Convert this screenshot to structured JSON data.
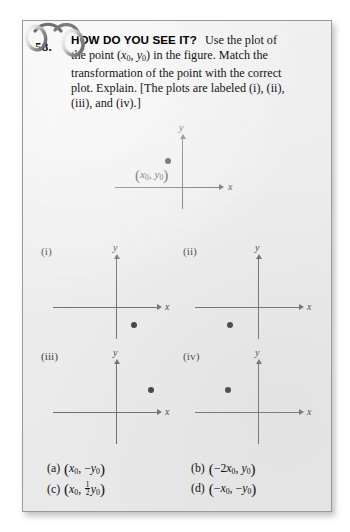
{
  "page": {
    "background_color": "#ededed",
    "border_color": "#9a9a9a",
    "outer_background": "#ffffff"
  },
  "problem": {
    "number": "58.",
    "callout_title": "HOW DO YOU SEE IT?",
    "body_line_1_pre": "Use the plot of",
    "body_line_2_a": "the point (",
    "body_line_2_x": "x",
    "body_line_2_sub0a": "0",
    "body_line_2_comma": ", ",
    "body_line_2_y": "y",
    "body_line_2_sub0b": "0",
    "body_line_2_b": ") in the figure. Match the",
    "body_line_3": "transformation of the point with the correct",
    "body_line_4": "plot. Explain. [The plots are labeled (i), (ii),",
    "body_line_5": "(iii), and (iv).]"
  },
  "main_plot": {
    "name": "main-plot",
    "axis_x_label": "x",
    "axis_y_label": "y",
    "point_label_open": "(",
    "point_label_x": "x",
    "point_label_x_sub": "0",
    "point_label_sep": ", ",
    "point_label_y": "y",
    "point_label_y_sub": "0",
    "point_label_close": ")",
    "point_quadrant": "II",
    "point_x_rel": -14,
    "point_y_rel": 26
  },
  "subplots": [
    {
      "id": "i",
      "label": "(i)",
      "axis_x_label": "x",
      "axis_y_label": "y",
      "point_quadrant": "IV",
      "point_x_rel": 18,
      "point_y_rel": -18
    },
    {
      "id": "ii",
      "label": "(ii)",
      "axis_x_label": "x",
      "axis_y_label": "y",
      "point_quadrant": "III",
      "point_x_rel": -28,
      "point_y_rel": -18
    },
    {
      "id": "iii",
      "label": "(iii)",
      "axis_x_label": "x",
      "axis_y_label": "y",
      "point_quadrant": "I",
      "point_x_rel": 35,
      "point_y_rel": 22
    },
    {
      "id": "iv",
      "label": "(iv)",
      "axis_x_label": "x",
      "axis_y_label": "y",
      "point_quadrant": "II",
      "point_x_rel": -30,
      "point_y_rel": 22
    }
  ],
  "answers": [
    {
      "tag": "(a)",
      "expr_plain": "(x0, -y0)",
      "x_sign": "",
      "x_coef": "",
      "x_var": "x",
      "x_sub": "0",
      "y_sign": "−",
      "y_coef": "",
      "y_var": "y",
      "y_sub": "0",
      "y_is_fraction": false
    },
    {
      "tag": "(b)",
      "expr_plain": "(-2x0, y0)",
      "x_sign": "−",
      "x_coef": "2",
      "x_var": "x",
      "x_sub": "0",
      "y_sign": "",
      "y_coef": "",
      "y_var": "y",
      "y_sub": "0",
      "y_is_fraction": false
    },
    {
      "tag": "(c)",
      "expr_plain": "(x0, 1/2 y0)",
      "x_sign": "",
      "x_coef": "",
      "x_var": "x",
      "x_sub": "0",
      "y_sign": "",
      "y_coef_num": "1",
      "y_coef_den": "2",
      "y_var": "y",
      "y_sub": "0",
      "y_is_fraction": true
    },
    {
      "tag": "(d)",
      "expr_plain": "(-x0, -y0)",
      "x_sign": "−",
      "x_coef": "",
      "x_var": "x",
      "x_sub": "0",
      "y_sign": "−",
      "y_coef": "",
      "y_var": "y",
      "y_sub": "0",
      "y_is_fraction": false
    }
  ]
}
